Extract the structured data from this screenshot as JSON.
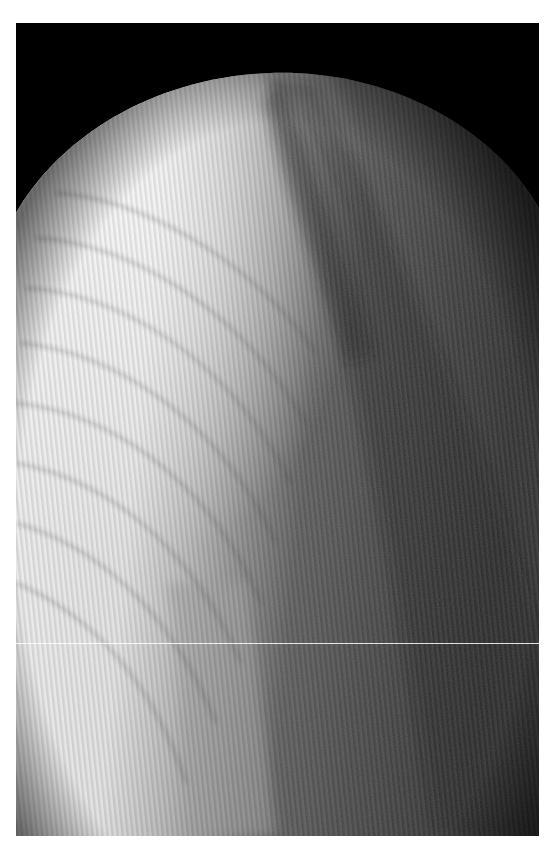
{
  "image": {
    "description": "Grayscale radiograph / micrograph of a domed specimen showing curved growth-ring bands and a dark diagonal core band",
    "background_color": "#000000",
    "margin_color": "#ffffff",
    "palette": {
      "highlight": "#f4f4f4",
      "midtone": "#9a9a9a",
      "shadow": "#2a2a2a",
      "outside": "#000000"
    },
    "artifacts": [
      "vertical scan stripes",
      "thin horizontal white line near bottom"
    ]
  }
}
